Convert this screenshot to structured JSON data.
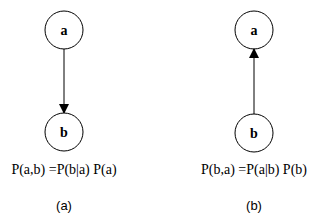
{
  "diagrams": [
    {
      "id": "a",
      "nodes": [
        {
          "label": "a"
        },
        {
          "label": "b"
        }
      ],
      "edge": {
        "from": "a",
        "to": "b"
      },
      "equation": "P(a,b) =P(b|a) P(a)",
      "caption": "(a)"
    },
    {
      "id": "b",
      "nodes": [
        {
          "label": "a"
        },
        {
          "label": "b"
        }
      ],
      "edge": {
        "from": "b",
        "to": "a"
      },
      "equation": "P(b,a) =P(a|b) P(b)",
      "caption": "(b)"
    }
  ]
}
